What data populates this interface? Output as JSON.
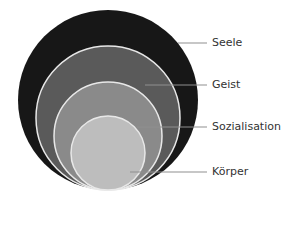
{
  "diagram": {
    "type": "nested-circles",
    "layers": [
      {
        "label": "Seele",
        "color": "#171717"
      },
      {
        "label": "Geist",
        "color": "#5a5a5a"
      },
      {
        "label": "Sozialisation",
        "color": "#8a8a8a"
      },
      {
        "label": "Körper",
        "color": "#bdbdbd"
      }
    ],
    "outline_color": "#e8e8e8",
    "leader_color": "#8f8f8f"
  }
}
